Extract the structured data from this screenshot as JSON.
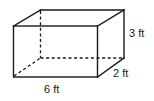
{
  "diagram": {
    "type": "rectangular-prism",
    "dimensions": {
      "length": {
        "value": 6,
        "unit": "ft",
        "label": "6 ft"
      },
      "width": {
        "value": 2,
        "unit": "ft",
        "label": "2 ft"
      },
      "height": {
        "value": 3,
        "unit": "ft",
        "label": "3 ft"
      }
    },
    "colors": {
      "stroke": "#1a1a1a",
      "background": "#ffffff"
    }
  }
}
